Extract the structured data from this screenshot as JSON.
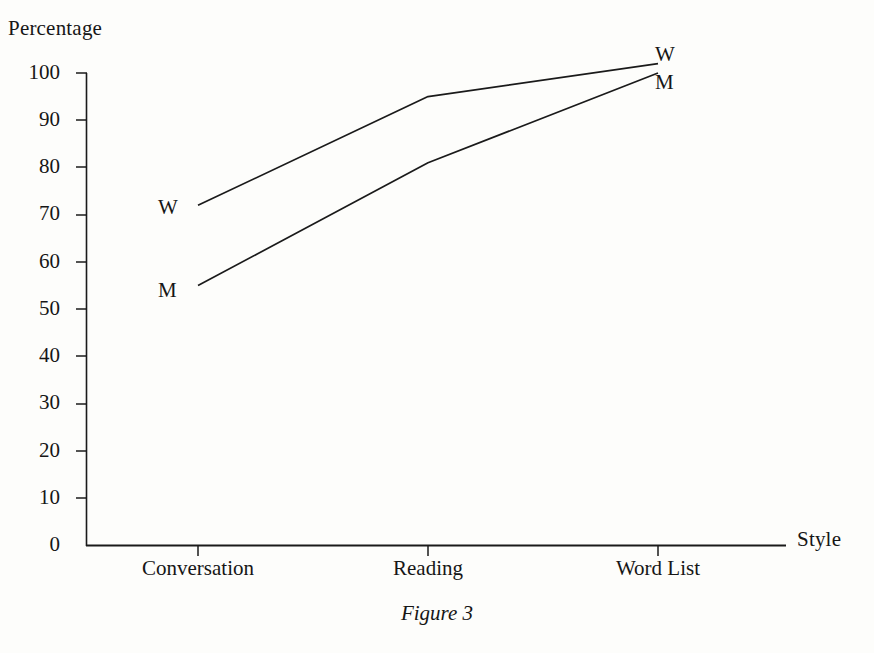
{
  "figure": {
    "caption": "Figure 3",
    "y_axis_title": "Percentage",
    "x_axis_title": "Style"
  },
  "chart_data": {
    "type": "line",
    "title": "Figure 3",
    "xlabel": "Style",
    "ylabel": "Percentage",
    "categories": [
      "Conversation",
      "Reading",
      "Word List"
    ],
    "ylim": [
      0,
      100
    ],
    "yticks": [
      0,
      10,
      20,
      30,
      40,
      50,
      60,
      70,
      80,
      90,
      100
    ],
    "ytick_labels": [
      "0",
      "10",
      "20",
      "30",
      "40",
      "50",
      "60",
      "70",
      "80",
      "90",
      "100"
    ],
    "grid": false,
    "legend": "inline-endpoint-labels",
    "series": [
      {
        "name": "W",
        "label_left": "W",
        "label_right": "W",
        "values": [
          72,
          95,
          102
        ]
      },
      {
        "name": "M",
        "label_left": "M",
        "label_right": "M",
        "values": [
          55,
          81,
          100
        ]
      }
    ],
    "colors": {
      "line": "#1a1a1a",
      "axis": "#1a1a1a",
      "background": "#fdfdfb",
      "text": "#161616"
    }
  }
}
